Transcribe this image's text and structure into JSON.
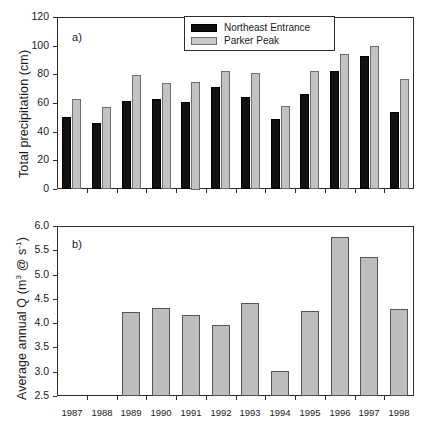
{
  "figure": {
    "panel_a_letter": "a)",
    "panel_b_letter": "b)"
  },
  "legend": {
    "items": [
      {
        "label": "Northeast Entrance",
        "color": "#111111",
        "swatch": "dark"
      },
      {
        "label": "Parker Peak",
        "color": "#c9c9c9",
        "swatch": "light"
      }
    ]
  },
  "axes": {
    "years": [
      "1987",
      "1988",
      "1989",
      "1990",
      "1991",
      "1992",
      "1993",
      "1994",
      "1995",
      "1996",
      "1997",
      "1998"
    ],
    "panel_a_yticks": [
      "0",
      "20",
      "40",
      "60",
      "80",
      "100",
      "120"
    ],
    "panel_b_yticks": [
      "2.5",
      "3.0",
      "3.5",
      "4.0",
      "4.5",
      "5.0",
      "5.5",
      "6.0"
    ],
    "panel_a_ylabel": "Total precipitation (cm)",
    "panel_b_ylabel_pre": "Average annual Q (m",
    "panel_b_ylabel_sup1": "3",
    "panel_b_ylabel_mid": " @ s",
    "panel_b_ylabel_sup2": "-1",
    "panel_b_ylabel_post": ")"
  },
  "chart_data": [
    {
      "type": "bar",
      "panel": "a)",
      "title": "Total precipitation (cm)",
      "xlabel": "",
      "ylabel": "Total precipitation (cm)",
      "ylim": [
        0,
        120
      ],
      "yticks": [
        0,
        20,
        40,
        60,
        80,
        100,
        120
      ],
      "grid": false,
      "legend_position": "top-center",
      "categories": [
        "1987",
        "1988",
        "1989",
        "1990",
        "1991",
        "1992",
        "1993",
        "1994",
        "1995",
        "1996",
        "1997",
        "1998"
      ],
      "series": [
        {
          "name": "Northeast Entrance",
          "color": "#111111",
          "values": [
            50,
            46,
            61.5,
            62.5,
            60.5,
            71,
            64,
            48.5,
            66.5,
            82.5,
            93,
            54
          ]
        },
        {
          "name": "Parker Peak",
          "color": "#c9c9c9",
          "values": [
            62.5,
            57.5,
            79.5,
            74,
            75,
            82,
            81,
            58,
            82,
            94,
            100,
            77
          ]
        }
      ]
    },
    {
      "type": "bar",
      "panel": "b)",
      "title": "Average annual Q (m3 @ s-1)",
      "xlabel": "",
      "ylabel": "Average annual Q (m3 @ s-1)",
      "ylim": [
        2.5,
        6.0
      ],
      "yticks": [
        2.5,
        3.0,
        3.5,
        4.0,
        4.5,
        5.0,
        5.5,
        6.0
      ],
      "grid": false,
      "legend_position": "none",
      "categories": [
        "1987",
        "1988",
        "1989",
        "1990",
        "1991",
        "1992",
        "1993",
        "1994",
        "1995",
        "1996",
        "1997",
        "1998"
      ],
      "series": [
        {
          "name": "Average annual Q",
          "color": "#bdbdbd",
          "values": [
            null,
            null,
            4.22,
            4.31,
            4.16,
            3.97,
            4.41,
            3.01,
            4.25,
            5.78,
            5.36,
            4.29
          ]
        }
      ]
    }
  ]
}
